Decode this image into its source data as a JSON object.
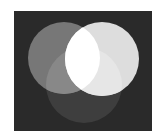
{
  "diagram": {
    "type": "venn-three-circle",
    "title": "",
    "canvas": {
      "width": 157,
      "height": 136,
      "page_bg": "#ffffff"
    },
    "panel": {
      "x": 14,
      "y": 11,
      "width": 138,
      "height": 120,
      "fill": "#2a2a2a"
    },
    "circles": [
      {
        "id": "left",
        "cx": 64,
        "cy": 58,
        "r": 36,
        "fill": "#777777"
      },
      {
        "id": "right",
        "cx": 102,
        "cy": 59,
        "r": 37,
        "fill": "#dddddd"
      },
      {
        "id": "bottom",
        "cx": 84,
        "cy": 85,
        "r": 38,
        "fill": "#3e3e3e"
      }
    ],
    "overlaps": {
      "left_right": "#ffffff",
      "left_bottom": "#888888",
      "right_bottom": "#e6e6e6",
      "all_three": "#ffffff"
    }
  }
}
